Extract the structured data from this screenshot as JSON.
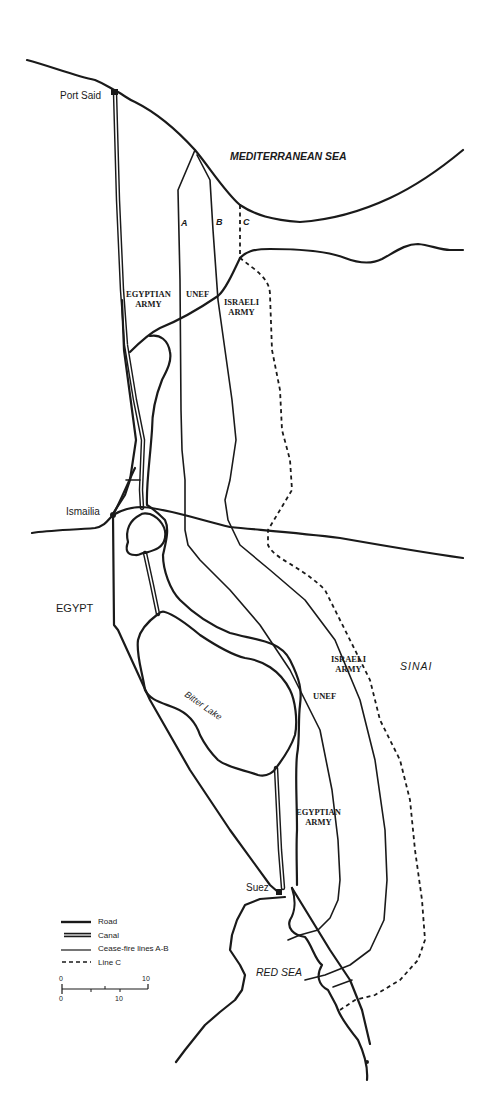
{
  "map": {
    "labels": {
      "port_said": "Port Said",
      "mediterranean_sea": "MEDITERRANEAN SEA",
      "line_a": "A",
      "line_b": "B",
      "line_c": "C",
      "ismailia": "Ismailia",
      "egypt": "EGYPT",
      "sinai": "SINAI",
      "bitter_lake": "Bitter Lake",
      "suez": "Suez",
      "red_sea": "RED SEA"
    },
    "zones_north": {
      "egyptian_army": [
        "EGYPTIAN",
        "ARMY"
      ],
      "unef": "UNEF",
      "israeli_army": [
        "ISRAELI",
        "ARMY"
      ]
    },
    "zones_south": {
      "israeli_army": [
        "ISRAELI",
        "ARMY"
      ],
      "unef": "UNEF",
      "egyptian_army": [
        "EGYPTIAN",
        "ARMY"
      ]
    },
    "legend": [
      {
        "symbol": "road-line",
        "label": "Road"
      },
      {
        "symbol": "canal-line",
        "label": "Canal"
      },
      {
        "symbol": "ceasefire-line",
        "label": "Cease-fire lines  A-B"
      },
      {
        "symbol": "dashed-line",
        "label": "Line C"
      }
    ],
    "scale": {
      "top_start": "0",
      "top_end": "10",
      "bottom_start": "0",
      "bottom_end": "10"
    },
    "colors": {
      "ink": "#1a1a1a",
      "paper": "#ffffff"
    }
  }
}
